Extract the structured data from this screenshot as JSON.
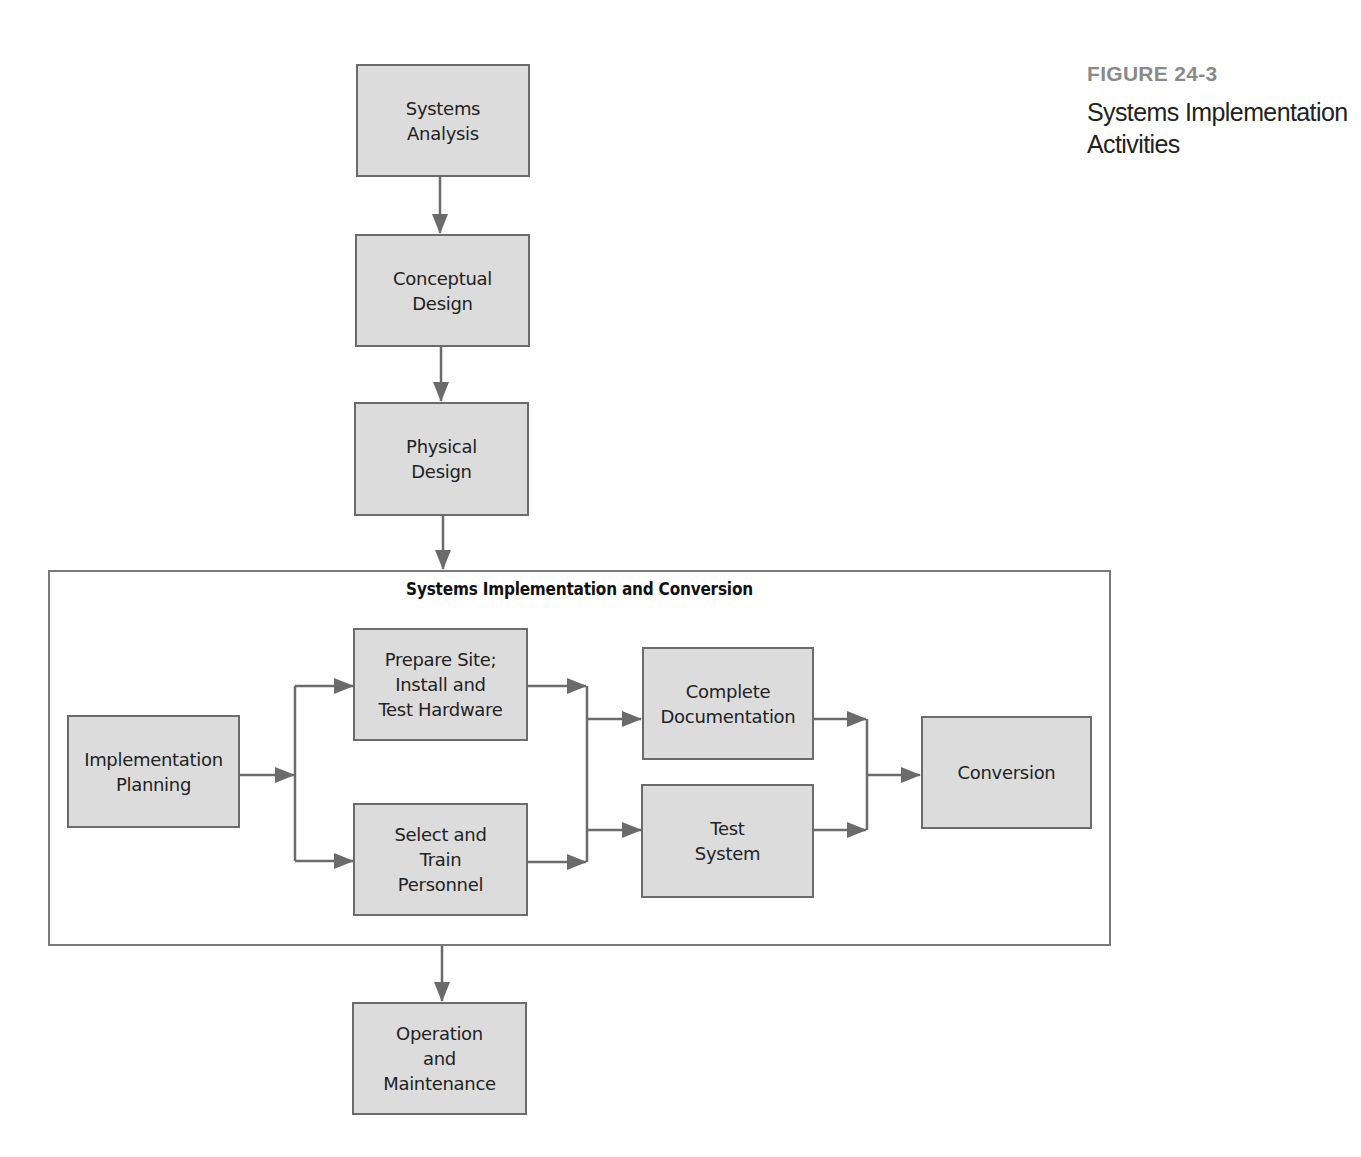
{
  "figure": {
    "label": "FIGURE 24-3",
    "caption": "Systems Implementation\nActivities"
  },
  "colors": {
    "box_fill": "#dcdcdc",
    "box_border": "#6b6b6b",
    "arrow": "#6b6b6b",
    "figure_label": "#8a8a8a"
  },
  "diagram": {
    "phases": {
      "systems_analysis": "Systems\nAnalysis",
      "conceptual_design": "Conceptual\nDesign",
      "physical_design": "Physical\nDesign",
      "operation_maintenance": "Operation\nand\nMaintenance"
    },
    "implementation_group": {
      "title": "Systems Implementation and Conversion",
      "implementation_planning": "Implementation\nPlanning",
      "prepare_site": "Prepare Site;\nInstall and\nTest Hardware",
      "select_train": "Select and\nTrain\nPersonnel",
      "complete_documentation": "Complete\nDocumentation",
      "test_system": "Test\nSystem",
      "conversion": "Conversion"
    },
    "edges": [
      [
        "Systems Analysis",
        "Conceptual Design"
      ],
      [
        "Conceptual Design",
        "Physical Design"
      ],
      [
        "Physical Design",
        "Systems Implementation and Conversion"
      ],
      [
        "Implementation Planning",
        "Prepare Site; Install and Test Hardware"
      ],
      [
        "Implementation Planning",
        "Select and Train Personnel"
      ],
      [
        "Prepare Site; Install and Test Hardware",
        "Complete Documentation"
      ],
      [
        "Prepare Site; Install and Test Hardware",
        "Test System"
      ],
      [
        "Select and Train Personnel",
        "Complete Documentation"
      ],
      [
        "Select and Train Personnel",
        "Test System"
      ],
      [
        "Complete Documentation",
        "Conversion"
      ],
      [
        "Test System",
        "Conversion"
      ],
      [
        "Systems Implementation and Conversion",
        "Operation and Maintenance"
      ]
    ]
  }
}
